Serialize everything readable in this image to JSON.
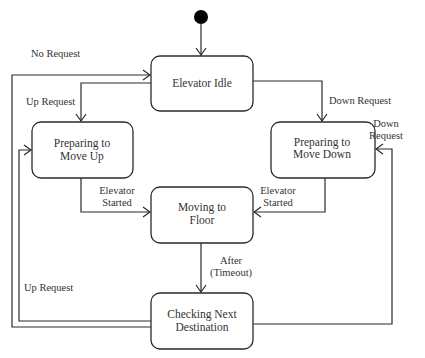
{
  "diagram": {
    "type": "uml-state-machine",
    "initial_state": "Elevator Idle",
    "states": [
      {
        "id": "idle",
        "lines": [
          "Elevator Idle"
        ]
      },
      {
        "id": "prep_up",
        "lines": [
          "Preparing to",
          "Move Up"
        ]
      },
      {
        "id": "prep_down",
        "lines": [
          "Preparing to",
          "Move Down"
        ]
      },
      {
        "id": "moving",
        "lines": [
          "Moving to",
          "Floor"
        ]
      },
      {
        "id": "checking",
        "lines": [
          "Checking Next",
          "Destination"
        ]
      }
    ],
    "transitions": [
      {
        "from": "initial",
        "to": "idle",
        "label_lines": []
      },
      {
        "from": "idle",
        "to": "prep_up",
        "label_lines": [
          "Up Request"
        ]
      },
      {
        "from": "idle",
        "to": "prep_down",
        "label_lines": [
          "Down Request"
        ]
      },
      {
        "from": "prep_up",
        "to": "moving",
        "label_lines": [
          "Elevator",
          "Started"
        ]
      },
      {
        "from": "prep_down",
        "to": "moving",
        "label_lines": [
          "Elevator",
          "Started"
        ]
      },
      {
        "from": "moving",
        "to": "checking",
        "label_lines": [
          "After",
          "(Timeout)"
        ]
      },
      {
        "from": "checking",
        "to": "idle",
        "label_lines": [
          "No Request"
        ]
      },
      {
        "from": "checking",
        "to": "prep_up",
        "label_lines": [
          "Up Request"
        ]
      },
      {
        "from": "checking",
        "to": "prep_down",
        "label_lines": [
          "Down",
          "Request"
        ]
      }
    ]
  }
}
